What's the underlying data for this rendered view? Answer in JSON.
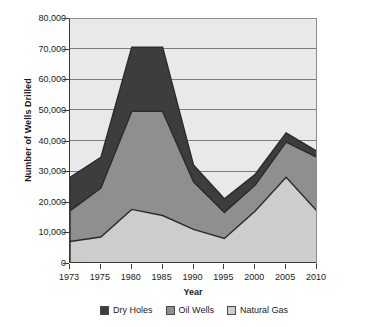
{
  "chart_data": {
    "type": "area",
    "stacked": true,
    "title": "",
    "xlabel": "Year",
    "ylabel": "Number of Wells Drilled",
    "categories": [
      "1973",
      "1975",
      "1980",
      "1985",
      "1990",
      "1995",
      "2000",
      "2005",
      "2010"
    ],
    "x": [
      1973,
      1975,
      1980,
      1985,
      1990,
      1995,
      2000,
      2005,
      2010
    ],
    "series": [
      {
        "name": "Dry Holes",
        "color": "#3d3d3d",
        "values": [
          11000,
          10000,
          21000,
          21000,
          5500,
          4500,
          3500,
          3000,
          2000
        ],
        "cumulative_top": [
          28000,
          34500,
          70500,
          70500,
          32000,
          21000,
          29000,
          42500,
          36500
        ]
      },
      {
        "name": "Oil Wells",
        "color": "#8f8f8f",
        "values": [
          10000,
          16000,
          32000,
          34000,
          15500,
          8500,
          8500,
          11500,
          17500
        ],
        "cumulative_top": [
          17000,
          24500,
          49500,
          49500,
          26500,
          16500,
          25500,
          39500,
          34500
        ]
      },
      {
        "name": "Natural Gas",
        "color": "#cdcdcd",
        "values": [
          7000,
          8500,
          17500,
          15500,
          11000,
          8000,
          17000,
          28000,
          17000
        ],
        "cumulative_top": [
          7000,
          8500,
          17500,
          15500,
          11000,
          8000,
          17000,
          28000,
          17000
        ]
      }
    ],
    "ylim": [
      0,
      80000
    ],
    "ytick_step": 10000,
    "ytick_labels": [
      "0",
      "10,000",
      "20,000",
      "30,000",
      "40,000",
      "50,000",
      "60,000",
      "70,000",
      "80,000"
    ],
    "ytick_values": [
      0,
      10000,
      20000,
      30000,
      40000,
      50000,
      60000,
      70000,
      80000
    ],
    "grid": true,
    "grid_axis": "y",
    "grid_color": "#7c7c7c",
    "legend_position": "bottom",
    "plot_background": "#e9e9e9",
    "axis_color": "#3a3a3a",
    "series_outline_color": "#2b2b2b"
  },
  "legend": {
    "items": [
      {
        "label": "Dry Holes",
        "color": "#3d3d3d"
      },
      {
        "label": "Oil Wells",
        "color": "#8f8f8f"
      },
      {
        "label": "Natural Gas",
        "color": "#cdcdcd"
      }
    ]
  }
}
